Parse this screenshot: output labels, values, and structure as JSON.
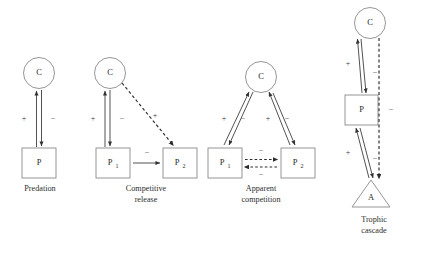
{
  "figure": {
    "background_color": "#ffffff",
    "shape_stroke_color": "#8a8a8a",
    "line_color": "#333333",
    "text_color": "#2a2a2a"
  },
  "panels": [
    {
      "id": "predation",
      "caption_lines": [
        "Predation"
      ],
      "nodes": [
        {
          "name": "consumer",
          "shape": "circle",
          "label": "C"
        },
        {
          "name": "prey",
          "shape": "square",
          "label": "P"
        }
      ],
      "links": [
        {
          "name": "prey-to-consumer",
          "style": "solid",
          "sign": "+"
        },
        {
          "name": "consumer-to-prey",
          "style": "solid",
          "sign": "−"
        }
      ]
    },
    {
      "id": "competitive-release",
      "caption_lines": [
        "Competitive",
        "release"
      ],
      "nodes": [
        {
          "name": "consumer",
          "shape": "circle",
          "label": "C"
        },
        {
          "name": "prey-1",
          "shape": "square",
          "label": "P",
          "subscript": "1"
        },
        {
          "name": "prey-2",
          "shape": "square",
          "label": "P",
          "subscript": "2"
        }
      ],
      "links": [
        {
          "name": "prey1-to-consumer",
          "style": "solid",
          "sign": "+"
        },
        {
          "name": "consumer-to-prey1",
          "style": "solid",
          "sign": "−"
        },
        {
          "name": "consumer-to-prey2-indirect",
          "style": "dashed",
          "sign": "+"
        },
        {
          "name": "prey1-to-prey2",
          "style": "solid",
          "sign": "−"
        }
      ]
    },
    {
      "id": "apparent-competition",
      "caption_lines": [
        "Apparent",
        "competition"
      ],
      "nodes": [
        {
          "name": "consumer",
          "shape": "circle",
          "label": "C"
        },
        {
          "name": "prey-1",
          "shape": "square",
          "label": "P",
          "subscript": "1"
        },
        {
          "name": "prey-2",
          "shape": "square",
          "label": "P",
          "subscript": "2"
        }
      ],
      "links": [
        {
          "name": "prey1-to-consumer",
          "style": "solid",
          "sign": "+"
        },
        {
          "name": "consumer-to-prey1",
          "style": "solid",
          "sign": "−"
        },
        {
          "name": "prey2-to-consumer",
          "style": "solid",
          "sign": "+"
        },
        {
          "name": "consumer-to-prey2",
          "style": "solid",
          "sign": "−"
        },
        {
          "name": "prey1-to-prey2-indirect",
          "style": "dashed",
          "sign": "−"
        },
        {
          "name": "prey2-to-prey1-indirect",
          "style": "dashed",
          "sign": "−"
        }
      ]
    },
    {
      "id": "trophic-cascade",
      "caption_lines": [
        "Trophic",
        "cascade"
      ],
      "nodes": [
        {
          "name": "consumer",
          "shape": "circle",
          "label": "C"
        },
        {
          "name": "predator-prey",
          "shape": "square",
          "label": "P"
        },
        {
          "name": "autotroph",
          "shape": "triangle",
          "label": "A"
        }
      ],
      "links": [
        {
          "name": "prey-to-consumer",
          "style": "solid",
          "sign": "+"
        },
        {
          "name": "consumer-to-prey",
          "style": "solid",
          "sign": "−"
        },
        {
          "name": "autotroph-to-prey",
          "style": "solid",
          "sign": "+"
        },
        {
          "name": "prey-to-autotroph",
          "style": "solid",
          "sign": "−"
        },
        {
          "name": "consumer-to-autotroph-indirect",
          "style": "dashed",
          "sign": "−"
        }
      ]
    }
  ]
}
